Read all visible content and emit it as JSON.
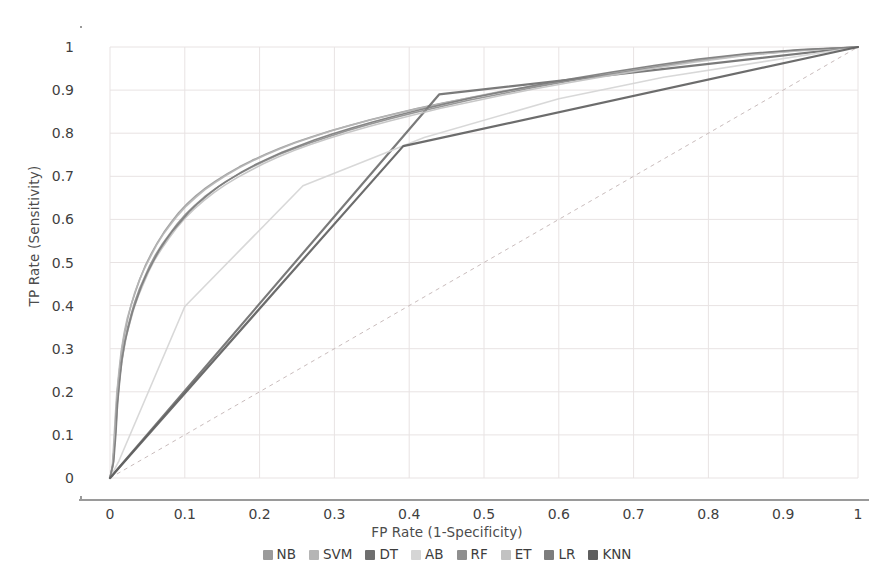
{
  "chart_data": {
    "type": "line",
    "title": "",
    "xlabel": "FP Rate (1-Specificity)",
    "ylabel": "TP Rate (Sensitivity)",
    "xlim": [
      0,
      1
    ],
    "ylim": [
      0,
      1
    ],
    "grid": true,
    "legend_position": "bottom",
    "xticks": [
      "0",
      "0.1",
      "0.2",
      "0.3",
      "0.4",
      "0.5",
      "0.6",
      "0.7",
      "0.8",
      "0.9",
      "1"
    ],
    "yticks": [
      "0",
      "0.1",
      "0.2",
      "0.3",
      "0.4",
      "0.5",
      "0.6",
      "0.7",
      "0.8",
      "0.9",
      "1"
    ],
    "xtick_values": [
      0,
      0.1,
      0.2,
      0.3,
      0.4,
      0.5,
      0.6,
      0.7,
      0.8,
      0.9,
      1
    ],
    "ytick_values": [
      0,
      0.1,
      0.2,
      0.3,
      0.4,
      0.5,
      0.6,
      0.7,
      0.8,
      0.9,
      1
    ],
    "reference_line": {
      "name": "chance-diagonal",
      "style": "dashed",
      "color": "#c9bcbc",
      "points": [
        [
          0,
          0
        ],
        [
          1,
          1
        ]
      ]
    },
    "series": [
      {
        "name": "NB",
        "color": "#9b9b9b",
        "width": 1.6,
        "points": [
          [
            0.0,
            0.0
          ],
          [
            0.004,
            0.03
          ],
          [
            0.006,
            0.09
          ],
          [
            0.008,
            0.15
          ],
          [
            0.01,
            0.205
          ],
          [
            0.013,
            0.255
          ],
          [
            0.016,
            0.3
          ],
          [
            0.02,
            0.34
          ],
          [
            0.024,
            0.372
          ],
          [
            0.028,
            0.4
          ],
          [
            0.034,
            0.432
          ],
          [
            0.04,
            0.462
          ],
          [
            0.047,
            0.492
          ],
          [
            0.055,
            0.52
          ],
          [
            0.063,
            0.545
          ],
          [
            0.072,
            0.57
          ],
          [
            0.082,
            0.594
          ],
          [
            0.092,
            0.616
          ],
          [
            0.103,
            0.636
          ],
          [
            0.115,
            0.655
          ],
          [
            0.128,
            0.673
          ],
          [
            0.142,
            0.69
          ],
          [
            0.157,
            0.706
          ],
          [
            0.173,
            0.722
          ],
          [
            0.19,
            0.737
          ],
          [
            0.208,
            0.751
          ],
          [
            0.227,
            0.765
          ],
          [
            0.248,
            0.779
          ],
          [
            0.27,
            0.792
          ],
          [
            0.294,
            0.805
          ],
          [
            0.32,
            0.818
          ],
          [
            0.348,
            0.831
          ],
          [
            0.378,
            0.844
          ],
          [
            0.41,
            0.857
          ],
          [
            0.445,
            0.87
          ],
          [
            0.483,
            0.883
          ],
          [
            0.524,
            0.896
          ],
          [
            0.568,
            0.909
          ],
          [
            0.616,
            0.923
          ],
          [
            0.668,
            0.938
          ],
          [
            0.724,
            0.953
          ],
          [
            0.784,
            0.968
          ],
          [
            0.85,
            0.982
          ],
          [
            0.922,
            0.993
          ],
          [
            1.0,
            1.0
          ]
        ]
      },
      {
        "name": "SVM",
        "color": "#b5b5b5",
        "width": 1.6,
        "points": [
          [
            0.0,
            0.0
          ],
          [
            0.003,
            0.025
          ],
          [
            0.005,
            0.08
          ],
          [
            0.007,
            0.14
          ],
          [
            0.009,
            0.195
          ],
          [
            0.012,
            0.248
          ],
          [
            0.015,
            0.295
          ],
          [
            0.019,
            0.337
          ],
          [
            0.023,
            0.37
          ],
          [
            0.028,
            0.4
          ],
          [
            0.033,
            0.43
          ],
          [
            0.039,
            0.458
          ],
          [
            0.046,
            0.486
          ],
          [
            0.054,
            0.513
          ],
          [
            0.062,
            0.54
          ],
          [
            0.071,
            0.565
          ],
          [
            0.081,
            0.588
          ],
          [
            0.091,
            0.61
          ],
          [
            0.102,
            0.631
          ],
          [
            0.114,
            0.65
          ],
          [
            0.127,
            0.669
          ],
          [
            0.141,
            0.686
          ],
          [
            0.156,
            0.703
          ],
          [
            0.172,
            0.719
          ],
          [
            0.189,
            0.734
          ],
          [
            0.207,
            0.749
          ],
          [
            0.226,
            0.763
          ],
          [
            0.247,
            0.777
          ],
          [
            0.269,
            0.79
          ],
          [
            0.293,
            0.804
          ],
          [
            0.319,
            0.817
          ],
          [
            0.347,
            0.83
          ],
          [
            0.377,
            0.843
          ],
          [
            0.409,
            0.856
          ],
          [
            0.444,
            0.869
          ],
          [
            0.482,
            0.883
          ],
          [
            0.523,
            0.897
          ],
          [
            0.567,
            0.91
          ],
          [
            0.615,
            0.924
          ],
          [
            0.667,
            0.939
          ],
          [
            0.723,
            0.954
          ],
          [
            0.783,
            0.969
          ],
          [
            0.849,
            0.983
          ],
          [
            0.921,
            0.993
          ],
          [
            1.0,
            1.0
          ]
        ]
      },
      {
        "name": "DT",
        "color": "#6f6f6f",
        "width": 2.2,
        "points": [
          [
            0.0,
            0.0
          ],
          [
            0.44,
            0.89
          ],
          [
            1.0,
            1.0
          ]
        ]
      },
      {
        "name": "AB",
        "color": "#d5d5d5",
        "width": 1.6,
        "points": [
          [
            0.0,
            0.0
          ],
          [
            0.012,
            0.04
          ],
          [
            0.1,
            0.398
          ],
          [
            0.258,
            0.678
          ],
          [
            0.42,
            0.79
          ],
          [
            0.6,
            0.88
          ],
          [
            0.74,
            0.93
          ],
          [
            1.0,
            1.0
          ]
        ]
      },
      {
        "name": "RF",
        "color": "#8f8f8f",
        "width": 1.6,
        "points": [
          [
            0.0,
            0.0
          ],
          [
            0.004,
            0.035
          ],
          [
            0.007,
            0.1
          ],
          [
            0.009,
            0.163
          ],
          [
            0.012,
            0.218
          ],
          [
            0.015,
            0.266
          ],
          [
            0.019,
            0.308
          ],
          [
            0.023,
            0.345
          ],
          [
            0.028,
            0.378
          ],
          [
            0.033,
            0.408
          ],
          [
            0.039,
            0.437
          ],
          [
            0.046,
            0.465
          ],
          [
            0.053,
            0.492
          ],
          [
            0.061,
            0.518
          ],
          [
            0.07,
            0.543
          ],
          [
            0.08,
            0.567
          ],
          [
            0.09,
            0.59
          ],
          [
            0.101,
            0.612
          ],
          [
            0.113,
            0.632
          ],
          [
            0.126,
            0.652
          ],
          [
            0.14,
            0.67
          ],
          [
            0.155,
            0.688
          ],
          [
            0.171,
            0.704
          ],
          [
            0.188,
            0.72
          ],
          [
            0.206,
            0.735
          ],
          [
            0.225,
            0.75
          ],
          [
            0.246,
            0.764
          ],
          [
            0.268,
            0.778
          ],
          [
            0.292,
            0.792
          ],
          [
            0.318,
            0.806
          ],
          [
            0.346,
            0.82
          ],
          [
            0.376,
            0.834
          ],
          [
            0.408,
            0.848
          ],
          [
            0.443,
            0.862
          ],
          [
            0.481,
            0.877
          ],
          [
            0.522,
            0.891
          ],
          [
            0.566,
            0.906
          ],
          [
            0.614,
            0.921
          ],
          [
            0.666,
            0.936
          ],
          [
            0.722,
            0.951
          ],
          [
            0.782,
            0.967
          ],
          [
            0.848,
            0.981
          ],
          [
            0.92,
            0.992
          ],
          [
            1.0,
            1.0
          ]
        ]
      },
      {
        "name": "ET",
        "color": "#c2c2c2",
        "width": 1.6,
        "points": [
          [
            0.0,
            0.0
          ],
          [
            0.004,
            0.028
          ],
          [
            0.006,
            0.085
          ],
          [
            0.009,
            0.143
          ],
          [
            0.011,
            0.198
          ],
          [
            0.014,
            0.248
          ],
          [
            0.018,
            0.292
          ],
          [
            0.022,
            0.33
          ],
          [
            0.027,
            0.363
          ],
          [
            0.032,
            0.394
          ],
          [
            0.038,
            0.423
          ],
          [
            0.045,
            0.452
          ],
          [
            0.052,
            0.48
          ],
          [
            0.06,
            0.507
          ],
          [
            0.069,
            0.532
          ],
          [
            0.079,
            0.557
          ],
          [
            0.089,
            0.58
          ],
          [
            0.1,
            0.602
          ],
          [
            0.112,
            0.623
          ],
          [
            0.125,
            0.643
          ],
          [
            0.139,
            0.662
          ],
          [
            0.154,
            0.68
          ],
          [
            0.17,
            0.697
          ],
          [
            0.187,
            0.713
          ],
          [
            0.205,
            0.729
          ],
          [
            0.224,
            0.744
          ],
          [
            0.245,
            0.759
          ],
          [
            0.267,
            0.773
          ],
          [
            0.291,
            0.787
          ],
          [
            0.317,
            0.801
          ],
          [
            0.345,
            0.815
          ],
          [
            0.375,
            0.829
          ],
          [
            0.407,
            0.843
          ],
          [
            0.442,
            0.858
          ],
          [
            0.48,
            0.872
          ],
          [
            0.521,
            0.887
          ],
          [
            0.565,
            0.902
          ],
          [
            0.613,
            0.917
          ],
          [
            0.665,
            0.933
          ],
          [
            0.721,
            0.949
          ],
          [
            0.781,
            0.965
          ],
          [
            0.847,
            0.98
          ],
          [
            0.919,
            0.991
          ],
          [
            1.0,
            1.0
          ]
        ]
      },
      {
        "name": "LR",
        "color": "#7d7d7d",
        "width": 1.6,
        "points": [
          [
            0.0,
            0.0
          ],
          [
            0.005,
            0.038
          ],
          [
            0.008,
            0.105
          ],
          [
            0.01,
            0.17
          ],
          [
            0.013,
            0.226
          ],
          [
            0.016,
            0.274
          ],
          [
            0.02,
            0.316
          ],
          [
            0.025,
            0.352
          ],
          [
            0.03,
            0.385
          ],
          [
            0.036,
            0.416
          ],
          [
            0.042,
            0.445
          ],
          [
            0.049,
            0.473
          ],
          [
            0.057,
            0.5
          ],
          [
            0.065,
            0.526
          ],
          [
            0.074,
            0.55
          ],
          [
            0.084,
            0.574
          ],
          [
            0.095,
            0.596
          ],
          [
            0.106,
            0.618
          ],
          [
            0.118,
            0.638
          ],
          [
            0.131,
            0.657
          ],
          [
            0.145,
            0.676
          ],
          [
            0.16,
            0.693
          ],
          [
            0.176,
            0.71
          ],
          [
            0.193,
            0.726
          ],
          [
            0.211,
            0.741
          ],
          [
            0.23,
            0.756
          ],
          [
            0.251,
            0.77
          ],
          [
            0.273,
            0.784
          ],
          [
            0.297,
            0.798
          ],
          [
            0.323,
            0.812
          ],
          [
            0.351,
            0.826
          ],
          [
            0.381,
            0.84
          ],
          [
            0.413,
            0.854
          ],
          [
            0.448,
            0.868
          ],
          [
            0.486,
            0.883
          ],
          [
            0.527,
            0.897
          ],
          [
            0.571,
            0.912
          ],
          [
            0.619,
            0.927
          ],
          [
            0.671,
            0.942
          ],
          [
            0.727,
            0.957
          ],
          [
            0.787,
            0.972
          ],
          [
            0.853,
            0.985
          ],
          [
            0.924,
            0.994
          ],
          [
            1.0,
            1.0
          ]
        ]
      },
      {
        "name": "KNN",
        "color": "#5f5f5f",
        "width": 2.2,
        "points": [
          [
            0.0,
            0.0
          ],
          [
            0.392,
            0.77
          ],
          [
            1.0,
            1.0
          ]
        ]
      }
    ]
  },
  "legend": {
    "items": [
      {
        "label": "NB",
        "color": "#9b9b9b"
      },
      {
        "label": "SVM",
        "color": "#b5b5b5"
      },
      {
        "label": "DT",
        "color": "#6f6f6f"
      },
      {
        "label": "AB",
        "color": "#d5d5d5"
      },
      {
        "label": "RF",
        "color": "#8f8f8f"
      },
      {
        "label": "ET",
        "color": "#c2c2c2"
      },
      {
        "label": "LR",
        "color": "#7d7d7d"
      },
      {
        "label": "KNN",
        "color": "#5f5f5f"
      }
    ]
  },
  "style": {
    "background": "#ffffff",
    "grid_color": "#e8e3e3",
    "axis_color": "#9a9a9a",
    "text_color": "#3f3f3f"
  }
}
